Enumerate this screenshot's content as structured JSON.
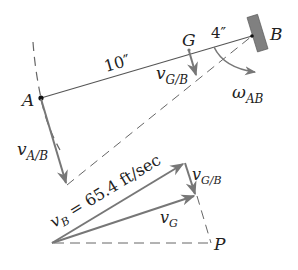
{
  "diagram": {
    "points": {
      "A": "A",
      "B": "B",
      "G": "G",
      "P": "P"
    },
    "dimensions": {
      "AG": "10″",
      "GB": "4″"
    },
    "vectors": {
      "vAB_main": "v",
      "vAB_sub": "A/B",
      "vGB_main": "v",
      "vGB_sub": "G/B",
      "omega_main": "ω",
      "omega_sub": "AB",
      "vB_main": "v",
      "vB_sub": "B",
      "vB_value": " = 65.4 ft/sec",
      "vGB2_main": "v",
      "vGB2_sub": "G/B",
      "vG_main": "v",
      "vG_sub": "G"
    },
    "colors": {
      "line": "#555555",
      "vector": "#7a7a7a",
      "wall": "#777777",
      "text": "#222222"
    }
  }
}
